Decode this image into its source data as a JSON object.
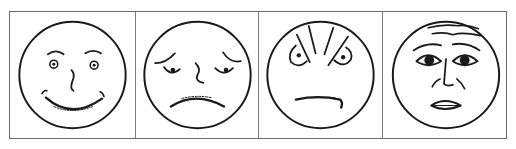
{
  "figure": {
    "panel_count": 4,
    "line_color": "#1a1a1a",
    "border_color": "#6a6a6a",
    "background": "#ffffff",
    "panels": [
      {
        "expression": "happy",
        "icon": "happy-face-icon"
      },
      {
        "expression": "sad",
        "icon": "sad-face-icon"
      },
      {
        "expression": "angry",
        "icon": "angry-face-icon"
      },
      {
        "expression": "afraid",
        "icon": "afraid-face-icon"
      }
    ]
  }
}
